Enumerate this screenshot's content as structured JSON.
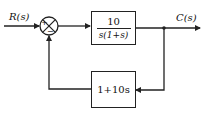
{
  "diagram": {
    "type": "feedback-control-block-diagram",
    "input_label": "R(s)",
    "output_label": "C(s)",
    "summing_junction": {
      "plus_sign": "+",
      "minus_sign": "−"
    },
    "forward_block": {
      "numerator": "10",
      "denominator": "s(1+s)"
    },
    "feedback_block": {
      "transfer_function": "1+10s"
    },
    "colors": {
      "line": "#222222",
      "background": "#ffffff"
    }
  }
}
